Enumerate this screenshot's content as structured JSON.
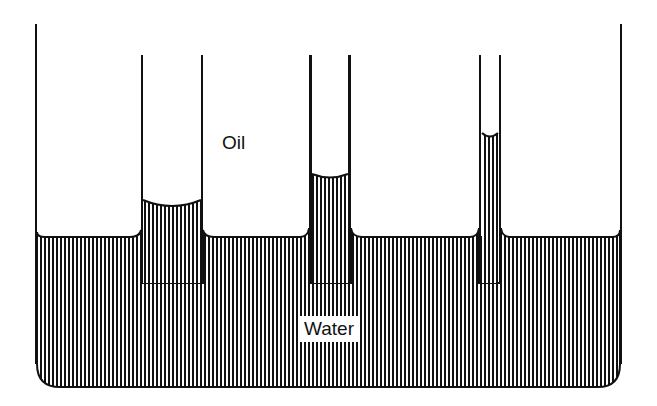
{
  "diagram": {
    "labels": {
      "oil": "Oil",
      "water": "Water"
    },
    "colors": {
      "ink": "#111111",
      "background": "#ffffff",
      "hatch": "#111111"
    },
    "parts": [
      {
        "name": "container",
        "description": "open vessel with oil layer over water"
      },
      {
        "name": "tube-wide",
        "description": "wide capillary tube, water rises slightly"
      },
      {
        "name": "tube-medium",
        "description": "medium capillary tube, water rises higher"
      },
      {
        "name": "tube-narrow",
        "description": "narrow capillary tube, water rises highest"
      }
    ]
  }
}
